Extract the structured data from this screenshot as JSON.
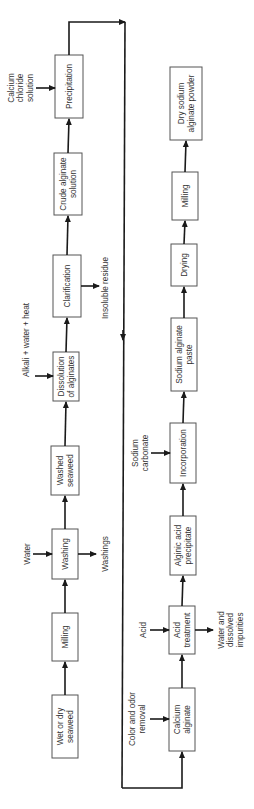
{
  "diagram": {
    "orientation": "rotated-90-ccw",
    "line_color": "#1a1a1a",
    "box_border_color": "#555555",
    "stage1": {
      "steps": [
        {
          "id": "wet-dry-seaweed",
          "lines": [
            "Wet or dry",
            "seaweed"
          ]
        },
        {
          "id": "milling-1",
          "lines": [
            "Milling"
          ]
        },
        {
          "id": "washing",
          "lines": [
            "Washing"
          ]
        },
        {
          "id": "washed-seaweed",
          "lines": [
            "Washed",
            "seaweed"
          ]
        },
        {
          "id": "dissolution",
          "lines": [
            "Dissolution",
            "of alginates"
          ]
        },
        {
          "id": "clarification",
          "lines": [
            "Clarification"
          ]
        },
        {
          "id": "crude-alginate-solution",
          "lines": [
            "Crude alginate",
            "solution"
          ]
        },
        {
          "id": "precipitation",
          "lines": [
            "Precipitation"
          ]
        }
      ],
      "inputs": [
        {
          "target": "washing",
          "lines": [
            "Water"
          ]
        },
        {
          "target": "dissolution",
          "lines": [
            "Alkali + water + heat"
          ]
        },
        {
          "target": "precipitation",
          "lines": [
            "Calcium",
            "chloride",
            "solution"
          ]
        }
      ],
      "outputs": [
        {
          "source": "washing",
          "lines": [
            "Washings"
          ]
        },
        {
          "source": "clarification",
          "lines": [
            "Insoluble residue"
          ]
        }
      ]
    },
    "stage2": {
      "steps": [
        {
          "id": "calcium-alginate",
          "lines": [
            "Calcium",
            "alginate"
          ]
        },
        {
          "id": "acid-treatment",
          "lines": [
            "Acid",
            "treatment"
          ]
        },
        {
          "id": "alginic-acid-precipitate",
          "lines": [
            "Alginic acid",
            "precipitate"
          ]
        },
        {
          "id": "incorporation",
          "lines": [
            "Incorporation"
          ]
        },
        {
          "id": "sodium-alginate-paste",
          "lines": [
            "Sodium alginate",
            "paste"
          ]
        },
        {
          "id": "drying",
          "lines": [
            "Drying"
          ]
        },
        {
          "id": "milling-2",
          "lines": [
            "Milling"
          ]
        },
        {
          "id": "dry-sodium-alginate-powder",
          "lines": [
            "Dry sodium",
            "alginate powder"
          ]
        }
      ],
      "inputs": [
        {
          "target": "calcium-alginate",
          "lines": [
            "Color and odor",
            "removal"
          ]
        },
        {
          "target": "acid-treatment",
          "lines": [
            "Acid"
          ]
        },
        {
          "target": "incorporation",
          "lines": [
            "Sodium",
            "carbonate"
          ]
        }
      ],
      "outputs": [
        {
          "source": "acid-treatment",
          "lines": [
            "Water and",
            "dissolved",
            "impurities"
          ]
        }
      ]
    }
  }
}
